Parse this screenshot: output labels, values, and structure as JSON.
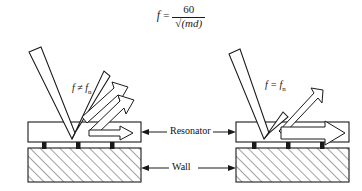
{
  "figure": {
    "background_color": "#ffffff",
    "line_color": "#1a1a1a",
    "hatch_color": "#555555"
  },
  "formula": {
    "lhs": "f",
    "equals": "=",
    "numerator": "60",
    "radical": "√",
    "denominator": "(md)",
    "plain_text": "f = 60 / √(md)"
  },
  "panels": {
    "left": {
      "condition_label": "f ≠ f",
      "condition_subscript": "n",
      "description": "off-resonance small vibration amplitude"
    },
    "right": {
      "condition_label": "f = f",
      "condition_subscript": "n",
      "description": "at-resonance large vibration amplitude"
    }
  },
  "annotations": {
    "resonator_label": "Resonator",
    "wall_label": "Wall"
  }
}
